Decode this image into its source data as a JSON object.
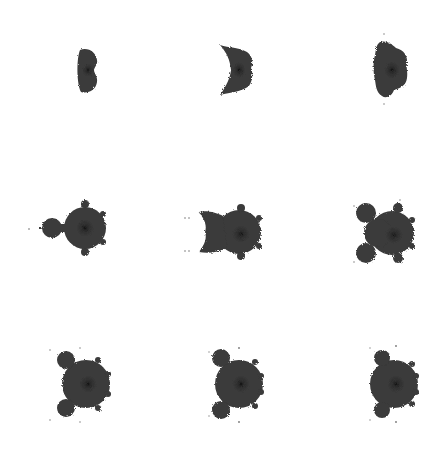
{
  "image": {
    "description": "3x3 grid of Multibrot/Mandelbrot-style fractal renderings on white background",
    "background": "#ffffff",
    "fill_color": "#3a3a3a",
    "core_color": "#0e0e0e"
  },
  "grid": {
    "rows": 3,
    "cols": 3,
    "cells": [
      {
        "id": "r1c1",
        "shape": "narrow-lens",
        "cx": 88,
        "cy": 70
      },
      {
        "id": "r1c2",
        "shape": "crescent-lens",
        "cx": 237,
        "cy": 70
      },
      {
        "id": "r1c3",
        "shape": "tall-blob",
        "cx": 392,
        "cy": 70
      },
      {
        "id": "r2c1",
        "shape": "classic-mandelbrot",
        "cx": 88,
        "cy": 228
      },
      {
        "id": "r2c2",
        "shape": "two-lobe-left",
        "cx": 237,
        "cy": 228
      },
      {
        "id": "r2c3",
        "shape": "two-bulb-left",
        "cx": 392,
        "cy": 228
      },
      {
        "id": "r3c1",
        "shape": "round-two-bulbs",
        "cx": 88,
        "cy": 383
      },
      {
        "id": "r3c2",
        "shape": "round-two-bulbs",
        "cx": 237,
        "cy": 383
      },
      {
        "id": "r3c3",
        "shape": "round-two-bulbs",
        "cx": 392,
        "cy": 383
      }
    ]
  }
}
